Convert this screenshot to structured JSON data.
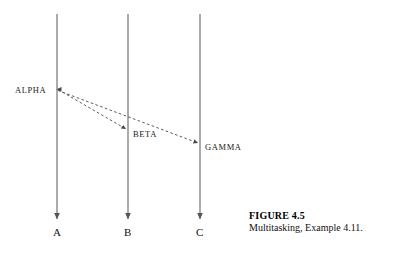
{
  "figure": {
    "caption_title": "FIGURE 4.5",
    "caption_text": "Multitasking, Example 4.11.",
    "background_color": "#ffffff",
    "line_color": "#555555",
    "text_color": "#111111"
  },
  "diagram": {
    "type": "sequence-diagram",
    "lifelines": [
      {
        "id": "A",
        "label": "A",
        "x": 57,
        "y_top": 14,
        "y_bottom": 219,
        "label_y": 228
      },
      {
        "id": "B",
        "label": "B",
        "x": 128,
        "y_top": 14,
        "y_bottom": 219,
        "label_y": 228
      },
      {
        "id": "C",
        "label": "C",
        "x": 200,
        "y_top": 14,
        "y_bottom": 219,
        "label_y": 228
      }
    ],
    "messages": [
      {
        "id": "alpha-to-beta",
        "label": "BETA",
        "from": "A",
        "to": "B",
        "x1": 57,
        "y1": 89,
        "x2": 128,
        "y2": 129,
        "style": "dashed",
        "label_x": 133,
        "label_y": 134
      },
      {
        "id": "alpha-to-gamma",
        "label": "GAMMA",
        "from": "A",
        "to": "C",
        "x1": 57,
        "y1": 90,
        "x2": 200,
        "y2": 143,
        "style": "dashed",
        "label_x": 205,
        "label_y": 147
      }
    ],
    "origin_label": {
      "id": "alpha",
      "label": "ALPHA",
      "x": 15,
      "y": 86
    }
  }
}
